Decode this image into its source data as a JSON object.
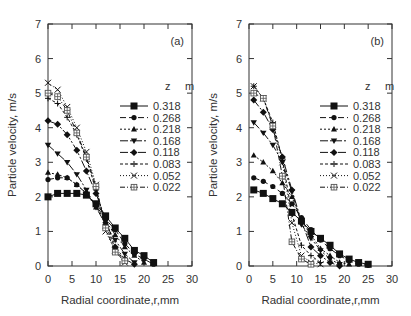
{
  "chart_data": [
    {
      "type": "line",
      "panel_label": "(a)",
      "xlabel": "Radial coordinate,r,mm",
      "ylabel": "Particle velocity, m/s",
      "xlim": [
        0,
        30
      ],
      "ylim": [
        0,
        7
      ],
      "xticks": [
        0,
        5,
        10,
        15,
        20,
        25,
        30
      ],
      "yticks": [
        0,
        1,
        2,
        3,
        4,
        5,
        6,
        7
      ],
      "legend_title_left": "z",
      "legend_title_right": "m",
      "legend_position": "right-middle",
      "series": [
        {
          "name": "0.318",
          "marker": "square",
          "dash": "",
          "x": [
            0,
            2,
            4,
            6,
            8,
            10,
            12,
            14,
            16,
            18,
            20,
            22
          ],
          "y": [
            2.0,
            2.1,
            2.1,
            2.1,
            2.05,
            1.8,
            1.45,
            1.1,
            0.8,
            0.45,
            0.3,
            0.1
          ]
        },
        {
          "name": "0.268",
          "marker": "circle",
          "dash": "6,3",
          "x": [
            0,
            2,
            4,
            6,
            8,
            10,
            12,
            14,
            16,
            18,
            20,
            22
          ],
          "y": [
            2.5,
            2.55,
            2.55,
            2.35,
            2.1,
            1.75,
            1.35,
            1.05,
            0.65,
            0.35,
            0.2,
            0.05
          ]
        },
        {
          "name": "0.218",
          "marker": "triangle-up",
          "dash": "2,2",
          "x": [
            0,
            2,
            4,
            6,
            8,
            10,
            12,
            14,
            16,
            18,
            20
          ],
          "y": [
            2.7,
            2.65,
            2.55,
            2.35,
            2.1,
            1.7,
            1.3,
            0.9,
            0.55,
            0.3,
            0.1
          ]
        },
        {
          "name": "0.168",
          "marker": "triangle-down",
          "dash": "8,2,2,2",
          "x": [
            0,
            2,
            4,
            6,
            8,
            10,
            12,
            14,
            16,
            18
          ],
          "y": [
            3.5,
            3.25,
            3.0,
            2.65,
            2.2,
            1.7,
            1.2,
            0.75,
            0.35,
            0.1
          ]
        },
        {
          "name": "0.118",
          "marker": "diamond",
          "dash": "8,2,2,2,2,2",
          "x": [
            0,
            2,
            4,
            6,
            8,
            10,
            12,
            14,
            16,
            18
          ],
          "y": [
            4.2,
            4.1,
            3.8,
            3.35,
            2.75,
            2.1,
            1.35,
            0.55,
            0.2,
            0.05
          ]
        },
        {
          "name": "0.083",
          "marker": "plus",
          "dash": "3,2",
          "x": [
            0,
            2,
            4,
            6,
            8,
            10,
            12,
            14,
            16
          ],
          "y": [
            4.85,
            4.7,
            4.3,
            3.8,
            3.1,
            2.2,
            1.2,
            0.5,
            0.15
          ]
        },
        {
          "name": "0.052",
          "marker": "cross",
          "dash": "1,2",
          "x": [
            0,
            2,
            4,
            6,
            8,
            10,
            12,
            14,
            16
          ],
          "y": [
            5.3,
            5.1,
            4.6,
            4.0,
            3.3,
            2.35,
            1.0,
            0.45,
            0.1
          ]
        },
        {
          "name": "0.022",
          "marker": "square-cross",
          "dash": "5,2,1,2",
          "x": [
            0,
            2,
            4,
            6,
            8,
            10,
            12,
            14,
            16
          ],
          "y": [
            5.0,
            4.9,
            4.5,
            3.85,
            3.15,
            2.3,
            1.1,
            0.4,
            0.15
          ]
        }
      ]
    },
    {
      "type": "line",
      "panel_label": "(b)",
      "xlabel": "Radial coordinate,r,mm",
      "ylabel": "Particle velocity, m/s",
      "xlim": [
        0,
        30
      ],
      "ylim": [
        0,
        7
      ],
      "xticks": [
        0,
        5,
        10,
        15,
        20,
        25,
        30
      ],
      "yticks": [
        0,
        1,
        2,
        3,
        4,
        5,
        6,
        7
      ],
      "legend_title_left": "z",
      "legend_title_right": "m",
      "legend_position": "right-middle",
      "series": [
        {
          "name": "0.318",
          "marker": "square",
          "dash": "",
          "x": [
            1,
            3,
            5,
            7,
            9,
            11,
            13,
            15,
            17,
            19,
            21,
            23,
            25
          ],
          "y": [
            2.2,
            2.1,
            1.95,
            1.8,
            1.55,
            1.3,
            1.0,
            0.8,
            0.6,
            0.35,
            0.2,
            0.1,
            0.05
          ]
        },
        {
          "name": "0.268",
          "marker": "circle",
          "dash": "6,3",
          "x": [
            1,
            3,
            5,
            7,
            9,
            11,
            13,
            15,
            17,
            19,
            21,
            23,
            25
          ],
          "y": [
            2.55,
            2.45,
            2.3,
            2.1,
            1.8,
            1.4,
            1.05,
            0.75,
            0.5,
            0.3,
            0.15,
            0.05,
            0.02
          ]
        },
        {
          "name": "0.218",
          "marker": "triangle-up",
          "dash": "2,2",
          "x": [
            1,
            3,
            5,
            7,
            9,
            11,
            13,
            15,
            17,
            19,
            21
          ],
          "y": [
            3.2,
            3.0,
            2.75,
            2.4,
            2.0,
            1.3,
            0.9,
            0.5,
            0.3,
            0.1,
            0.05
          ]
        },
        {
          "name": "0.168",
          "marker": "triangle-down",
          "dash": "8,2,2,2",
          "x": [
            1,
            3,
            5,
            7,
            9,
            11,
            13,
            15,
            17,
            19
          ],
          "y": [
            4.15,
            3.85,
            3.5,
            3.0,
            2.15,
            1.2,
            0.8,
            0.45,
            0.2,
            0.05
          ]
        },
        {
          "name": "0.118",
          "marker": "diamond",
          "dash": "8,2,2,2,2,2",
          "x": [
            1,
            3,
            5,
            7,
            9,
            11,
            13,
            15,
            17,
            19
          ],
          "y": [
            4.8,
            4.45,
            3.95,
            3.15,
            2.2,
            1.3,
            0.55,
            0.3,
            0.1,
            0.0
          ]
        },
        {
          "name": "0.083",
          "marker": "plus",
          "dash": "3,2",
          "x": [
            1,
            3,
            5,
            7,
            9,
            11,
            13,
            15
          ],
          "y": [
            5.2,
            4.85,
            4.15,
            3.1,
            1.5,
            0.6,
            0.3,
            0.1
          ]
        },
        {
          "name": "0.052",
          "marker": "cross",
          "dash": "1,2",
          "x": [
            1,
            3,
            5,
            7,
            9,
            11,
            13,
            15
          ],
          "y": [
            5.2,
            4.85,
            4.1,
            3.0,
            1.25,
            0.3,
            0.1,
            0.05
          ]
        },
        {
          "name": "0.022",
          "marker": "square-cross",
          "dash": "5,2,1,2",
          "x": [
            1,
            3,
            5,
            7,
            9,
            11,
            13
          ],
          "y": [
            5.0,
            4.85,
            4.05,
            2.6,
            0.7,
            0.2,
            0.05
          ]
        }
      ]
    }
  ],
  "panels": [
    {
      "label": "(a)"
    },
    {
      "label": "(b)"
    }
  ],
  "axes": {
    "xlabel": "Radial coordinate,r,mm",
    "ylabel": "Particle velocity, m/s"
  },
  "colors": {
    "line": "#111111",
    "axis": "#333333",
    "background": "#ffffff"
  }
}
